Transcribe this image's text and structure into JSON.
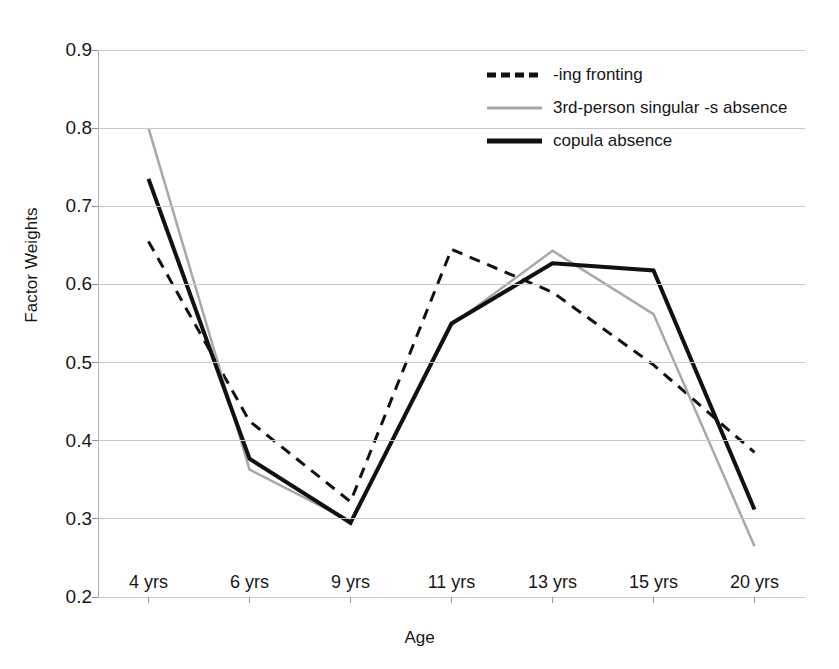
{
  "chart_data": {
    "type": "line",
    "title": "",
    "xlabel": "Age",
    "ylabel": "Factor Weights",
    "categories": [
      "4 yrs",
      "6 yrs",
      "9 yrs",
      "11 yrs",
      "13 yrs",
      "15 yrs",
      "20 yrs"
    ],
    "ylim": [
      0.2,
      0.9
    ],
    "yticks": [
      "0.2",
      "0.3",
      "0.4",
      "0.5",
      "0.6",
      "0.7",
      "0.8",
      "0.9"
    ],
    "grid": true,
    "legend_position": "top-right",
    "series": [
      {
        "name": "-ing fronting",
        "style": "dashed",
        "color": "#111111",
        "width": 3,
        "values": [
          0.655,
          0.425,
          0.322,
          0.645,
          0.59,
          0.497,
          0.385
        ]
      },
      {
        "name": "3rd-person singular -s absence",
        "style": "solid",
        "color": "#a8a8a8",
        "width": 2.5,
        "values": [
          0.8,
          0.363,
          0.297,
          0.548,
          0.643,
          0.562,
          0.265
        ]
      },
      {
        "name": "copula absence",
        "style": "solid",
        "color": "#111111",
        "width": 4,
        "values": [
          0.735,
          0.377,
          0.295,
          0.55,
          0.627,
          0.618,
          0.312
        ]
      }
    ]
  },
  "legend": {
    "items": [
      {
        "label": "-ing fronting",
        "swatch": "dashed-black-line-icon"
      },
      {
        "label": "3rd-person singular -s absence",
        "swatch": "solid-gray-line-icon"
      },
      {
        "label": "copula absence",
        "swatch": "solid-black-thick-line-icon"
      }
    ]
  },
  "axes": {
    "y_title": "Factor Weights",
    "x_title": "Age",
    "y_ticks": [
      "0.9",
      "0.8",
      "0.7",
      "0.6",
      "0.5",
      "0.4",
      "0.3",
      "0.2"
    ],
    "x_ticks": [
      "4 yrs",
      "6 yrs",
      "9 yrs",
      "11 yrs",
      "13 yrs",
      "15 yrs",
      "20 yrs"
    ]
  }
}
